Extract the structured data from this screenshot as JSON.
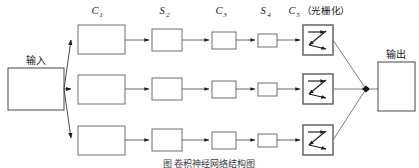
{
  "figure": {
    "caption": "图  卷积神经网络结构图",
    "background_color": "#ffffff",
    "stroke_color": "#6a6a6e",
    "text_color": "#161619"
  },
  "input_node": {
    "label": "输入",
    "name": "input"
  },
  "output_node": {
    "label": "输出",
    "name": "output"
  },
  "columns": [
    {
      "id": "c1",
      "base": "C",
      "subscript": "1",
      "label": "C₁",
      "annotation": ""
    },
    {
      "id": "s2",
      "base": "S",
      "subscript": "2",
      "label": "S₂",
      "annotation": ""
    },
    {
      "id": "c3",
      "base": "C",
      "subscript": "3",
      "label": "C₃",
      "annotation": ""
    },
    {
      "id": "s4",
      "base": "S",
      "subscript": "4",
      "label": "S₄",
      "annotation": ""
    },
    {
      "id": "c5",
      "base": "C",
      "subscript": "5",
      "label": "C₅",
      "annotation": "（光栅化）",
      "annotation_text": "光栅化",
      "paren_open": "（",
      "paren_close": "）"
    }
  ],
  "rows": [
    {
      "id": "row-1",
      "index": 1
    },
    {
      "id": "row-2",
      "index": 2
    },
    {
      "id": "row-3",
      "index": 3
    }
  ],
  "icons": {
    "rasterize": "zigzag-scan-icon",
    "merge": "merge-node-icon"
  },
  "geometry": {
    "width": 419,
    "height": 168,
    "row_y": [
      32,
      89,
      140
    ],
    "col_x": [
      78,
      152,
      212,
      258,
      303
    ],
    "box_w": [
      47,
      30,
      24,
      19,
      30
    ],
    "box_h": [
      29,
      22,
      17,
      13,
      30
    ],
    "input_box": {
      "x": 8,
      "y": 68,
      "w": 56,
      "h": 42
    },
    "output_box": {
      "x": 378,
      "y": 62,
      "w": 37,
      "h": 49
    },
    "merge_point": {
      "x": 366,
      "y": 89
    }
  }
}
